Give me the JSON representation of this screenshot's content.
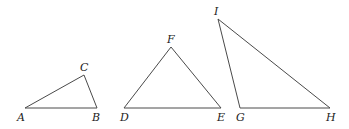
{
  "diagram": {
    "type": "geometry-triangles",
    "stroke_color": "#4a4a4a",
    "label_color": "#222222",
    "triangles": [
      {
        "name": "ABC",
        "vertices": [
          {
            "label": "A",
            "x": 25,
            "y": 108,
            "lx": 17,
            "ly": 121
          },
          {
            "label": "B",
            "x": 97,
            "y": 108,
            "lx": 92,
            "ly": 121
          },
          {
            "label": "C",
            "x": 84,
            "y": 75,
            "lx": 80,
            "ly": 71
          }
        ]
      },
      {
        "name": "DEF",
        "vertices": [
          {
            "label": "D",
            "x": 124,
            "y": 108,
            "lx": 120,
            "ly": 121
          },
          {
            "label": "E",
            "x": 221,
            "y": 108,
            "lx": 217,
            "ly": 121
          },
          {
            "label": "F",
            "x": 171,
            "y": 47,
            "lx": 167,
            "ly": 43
          }
        ]
      },
      {
        "name": "GHI",
        "vertices": [
          {
            "label": "G",
            "x": 240,
            "y": 108,
            "lx": 236,
            "ly": 121
          },
          {
            "label": "H",
            "x": 330,
            "y": 108,
            "lx": 326,
            "ly": 121
          },
          {
            "label": "I",
            "x": 218,
            "y": 19,
            "lx": 214,
            "ly": 15
          }
        ]
      }
    ]
  }
}
